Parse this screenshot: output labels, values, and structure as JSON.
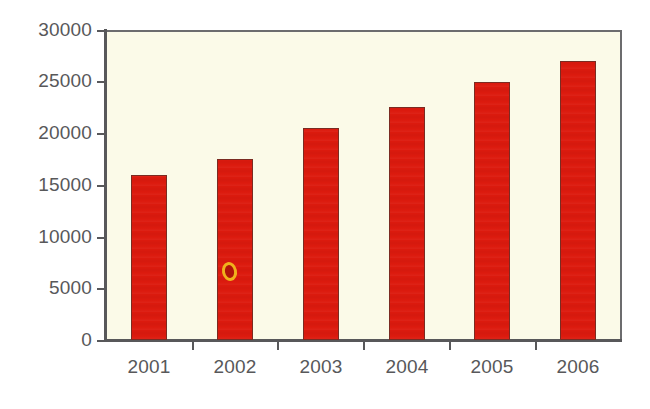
{
  "chart_data": {
    "type": "bar",
    "title": "",
    "subtitle": "",
    "xlabel": "",
    "ylabel": "",
    "categories": [
      "2001",
      "2002",
      "2003",
      "2004",
      "2005",
      "2006"
    ],
    "values": [
      16000,
      17500,
      20500,
      22500,
      25000,
      27000
    ],
    "series": [
      {
        "name": "",
        "values": [
          16000,
          17500,
          20500,
          22500,
          25000,
          27000
        ]
      }
    ],
    "ylim": [
      0,
      30000
    ],
    "y_ticks": [
      0,
      5000,
      10000,
      15000,
      20000,
      25000,
      30000
    ],
    "y_tick_labels": [
      "0",
      "5000",
      "10000",
      "15000",
      "20000",
      "25000",
      "30000"
    ],
    "x_tick_labels": [
      "2001",
      "2002",
      "2003",
      "2004",
      "2005",
      "2006"
    ],
    "grid": false,
    "legend": false,
    "legend_position": "none",
    "annotations": [],
    "colors": {
      "bar_fill": "#DC1A0E",
      "bar_edge": "#7A2B22",
      "plot_background": "#FBFAE8",
      "page_background": "#FFFFFF",
      "axis": "#58585A",
      "tick_label": "#58585A",
      "artifact": "#F0B21C"
    }
  },
  "figure": {
    "name": "bar-chart",
    "artifact_label": "scan-artifact"
  }
}
